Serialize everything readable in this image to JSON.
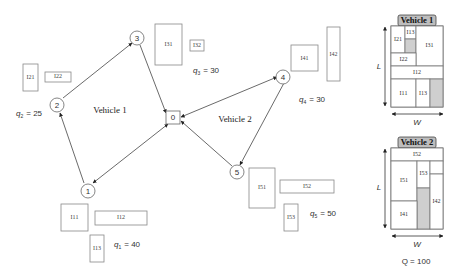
{
  "diagram": {
    "type": "vehicle-routing-with-loading",
    "depot": {
      "id": "0",
      "label": "0"
    },
    "customers": [
      {
        "id": "1",
        "label": "1",
        "demand_label": "q",
        "demand_sub": "1",
        "demand": "= 40",
        "items": [
          {
            "label": "I11"
          },
          {
            "label": "I12"
          },
          {
            "label": "I13"
          }
        ]
      },
      {
        "id": "2",
        "label": "2",
        "demand_label": "q",
        "demand_sub": "2",
        "demand": "= 25",
        "items": [
          {
            "label": "I21"
          },
          {
            "label": "I22"
          }
        ]
      },
      {
        "id": "3",
        "label": "3",
        "demand_label": "q",
        "demand_sub": "3",
        "demand": "= 30",
        "items": [
          {
            "label": "I31"
          },
          {
            "label": "I32"
          }
        ]
      },
      {
        "id": "4",
        "label": "4",
        "demand_label": "q",
        "demand_sub": "4",
        "demand": "= 30",
        "items": [
          {
            "label": "I41"
          },
          {
            "label": "I42"
          }
        ]
      },
      {
        "id": "5",
        "label": "5",
        "demand_label": "q",
        "demand_sub": "5",
        "demand": "= 50",
        "items": [
          {
            "label": "I51"
          },
          {
            "label": "I52"
          },
          {
            "label": "I53"
          }
        ]
      }
    ],
    "routes": [
      {
        "name": "Vehicle 1",
        "sequence": [
          "0",
          "1",
          "2",
          "3",
          "0"
        ]
      },
      {
        "name": "Vehicle 2",
        "sequence": [
          "0",
          "4",
          "5",
          "0"
        ]
      }
    ],
    "edges": [
      {
        "from": "0",
        "to": "1"
      },
      {
        "from": "1",
        "to": "2"
      },
      {
        "from": "2",
        "to": "3"
      },
      {
        "from": "3",
        "to": "0"
      },
      {
        "from": "0",
        "to": "4"
      },
      {
        "from": "4",
        "to": "5"
      },
      {
        "from": "5",
        "to": "0"
      }
    ],
    "loading": [
      {
        "title": "Vehicle 1",
        "items": [
          "I21",
          "I13",
          "I31",
          "I22",
          "I12",
          "I11",
          "I13b"
        ],
        "labels": {
          "I21": "I21",
          "I13": "I13",
          "I31": "I31",
          "I22": "I22",
          "I12": "I12",
          "I11": "I11",
          "I13b": "I13"
        }
      },
      {
        "title": "Vehicle 2",
        "items": [
          "I52",
          "I53",
          "I51",
          "I42",
          "I41"
        ],
        "labels": {
          "I52": "I52",
          "I53": "I53",
          "I51": "I51",
          "I42": "I42",
          "I41": "I41"
        }
      }
    ],
    "dim_length": "L",
    "dim_width": "W",
    "capacity": "Q = 100"
  }
}
